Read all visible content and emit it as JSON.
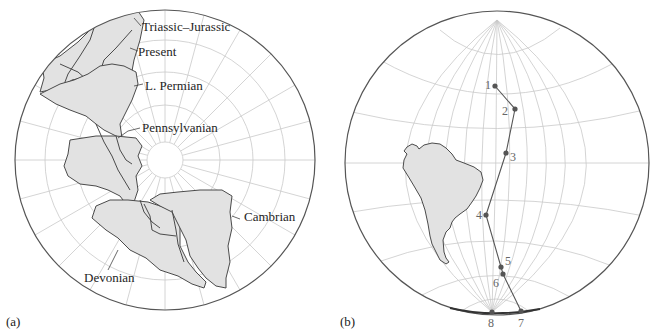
{
  "panel_a": {
    "label": "(a)",
    "labels": [
      {
        "text": "Triassic–Jurassic"
      },
      {
        "text": "Present"
      },
      {
        "text": "L. Permian"
      },
      {
        "text": "Pennsylvanian"
      },
      {
        "text": "Cambrian"
      },
      {
        "text": "Devonian"
      }
    ]
  },
  "panel_b": {
    "label": "(b)",
    "points": [
      {
        "n": "1"
      },
      {
        "n": "2"
      },
      {
        "n": "3"
      },
      {
        "n": "4"
      },
      {
        "n": "5"
      },
      {
        "n": "6"
      },
      {
        "n": "7"
      },
      {
        "n": "8"
      }
    ]
  },
  "colors": {
    "land_fill": "#e2e2e2",
    "outline": "#4a4a4a",
    "grid": "#c9c9c9",
    "path": "#555555"
  }
}
